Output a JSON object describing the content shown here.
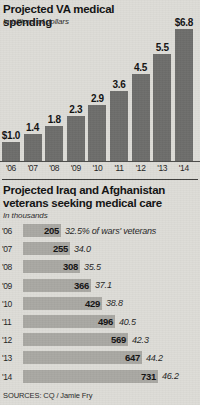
{
  "chart_data": [
    {
      "type": "bar",
      "orientation": "vertical",
      "title": "Projected VA medical spending",
      "subtitle": "In billions of dollars",
      "xlabel": "",
      "ylabel": "",
      "ylim": [
        0,
        6.8
      ],
      "grid": false,
      "legend": null,
      "categories": [
        "'06",
        "'07",
        "'08",
        "'09",
        "'10",
        "'11",
        "'12",
        "'13",
        "'14"
      ],
      "values": [
        1.0,
        1.4,
        1.8,
        2.3,
        2.9,
        3.6,
        4.5,
        5.5,
        6.8
      ],
      "data_labels": [
        "$1.0",
        "1.4",
        "1.8",
        "2.3",
        "2.9",
        "3.6",
        "4.5",
        "5.5",
        "$6.8"
      ],
      "bar_color": "#6d6d6b"
    },
    {
      "type": "bar",
      "orientation": "horizontal",
      "title": "Projected Iraq and Afghanistan veterans seeking medical care",
      "subtitle": "In thousands",
      "xlabel": "",
      "ylabel": "",
      "xlim": [
        0,
        731
      ],
      "grid": false,
      "legend": null,
      "categories": [
        "'06",
        "'07",
        "'08",
        "'09",
        "'10",
        "'11",
        "'12",
        "'13",
        "'14"
      ],
      "values": [
        205,
        255,
        308,
        366,
        429,
        496,
        569,
        647,
        731
      ],
      "data_labels": [
        "205",
        "255",
        "308",
        "366",
        "429",
        "496",
        "569",
        "647",
        "731"
      ],
      "annotations": [
        "32.5% of wars' veterans",
        "34.0",
        "35.5",
        "37.1",
        "38.8",
        "40.5",
        "42.3",
        "44.2",
        "46.2"
      ],
      "bar_color": "#a9a8a3"
    }
  ],
  "chart1": {
    "title": "Projected VA medical spending",
    "subtitle": "In billions of dollars",
    "bars": [
      {
        "year": "'06",
        "label": "$1.0"
      },
      {
        "year": "'07",
        "label": "1.4"
      },
      {
        "year": "'08",
        "label": "1.8"
      },
      {
        "year": "'09",
        "label": "2.3"
      },
      {
        "year": "'10",
        "label": "2.9"
      },
      {
        "year": "'11",
        "label": "3.6"
      },
      {
        "year": "'12",
        "label": "4.5"
      },
      {
        "year": "'13",
        "label": "5.5"
      },
      {
        "year": "'14",
        "label": "$6.8"
      }
    ]
  },
  "chart2": {
    "title": "Projected Iraq and Afghanistan veterans seeking medical care",
    "subtitle": "In thousands",
    "rows": [
      {
        "year": "'06",
        "value": "205",
        "pct": "32.5% of wars' veterans"
      },
      {
        "year": "'07",
        "value": "255",
        "pct": "34.0"
      },
      {
        "year": "'08",
        "value": "308",
        "pct": "35.5"
      },
      {
        "year": "'09",
        "value": "366",
        "pct": "37.1"
      },
      {
        "year": "'10",
        "value": "429",
        "pct": "38.8"
      },
      {
        "year": "'11",
        "value": "496",
        "pct": "40.5"
      },
      {
        "year": "'12",
        "value": "569",
        "pct": "42.3"
      },
      {
        "year": "'13",
        "value": "647",
        "pct": "44.2"
      },
      {
        "year": "'14",
        "value": "731",
        "pct": "46.2"
      }
    ]
  },
  "footer": {
    "sources": "SOURCES: CQ / Jamie Fry"
  }
}
